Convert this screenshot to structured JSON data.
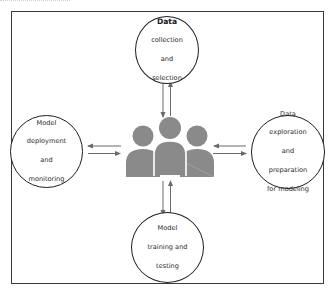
{
  "diagram": {
    "type": "hub-and-spoke",
    "center": {
      "label": "Team / people",
      "icon": "people-group-icon",
      "color": "#8a8a8a"
    },
    "nodes": [
      {
        "id": "top",
        "position": "top",
        "lines": [
          "Data",
          "collection",
          "and",
          "selection"
        ]
      },
      {
        "id": "right",
        "position": "right",
        "lines": [
          "Data",
          "exploration",
          "and",
          "preparation",
          "for modeling"
        ]
      },
      {
        "id": "bottom",
        "position": "bottom",
        "lines": [
          "Model",
          "training and",
          "testing"
        ]
      },
      {
        "id": "left",
        "position": "left",
        "lines": [
          "Model",
          "deployment",
          "and",
          "monitoring"
        ]
      }
    ],
    "edges": [
      {
        "from": "center",
        "to": "top",
        "bidirectional": true
      },
      {
        "from": "center",
        "to": "right",
        "bidirectional": true
      },
      {
        "from": "center",
        "to": "bottom",
        "bidirectional": true
      },
      {
        "from": "center",
        "to": "left",
        "bidirectional": true
      }
    ],
    "colors": {
      "frame": "#3a3a3a",
      "node_border": "#1e1e1e",
      "arrow": "#6a6a6a",
      "people": "#8a8a8a",
      "text": "#2a2a2a"
    }
  }
}
